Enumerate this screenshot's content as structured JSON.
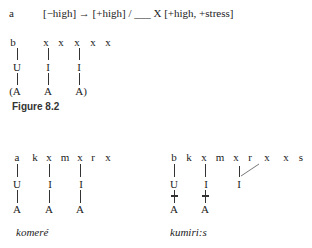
{
  "rule": {
    "label": "a",
    "text": "[−high] → [+high] / ___ X  [+high, +stress]"
  },
  "diagram_b": {
    "label": "b",
    "skeleton": [
      "x",
      "x",
      "x",
      "x",
      "x"
    ],
    "melody_upper": [
      "U",
      "I",
      "I"
    ],
    "melody_lower": [
      "(A",
      "A",
      "A)"
    ]
  },
  "figure_caption": "Figure 8.2",
  "left_example": {
    "segments": [
      "a",
      "k",
      "x",
      "m",
      "x",
      "r",
      "x"
    ],
    "upper": [
      "U",
      "I",
      "I"
    ],
    "lower": [
      "A",
      "A",
      "A"
    ],
    "gloss": "komeré"
  },
  "right_example": {
    "segments": [
      "b",
      "k",
      "x",
      "m",
      "x",
      "r",
      "x",
      "x",
      "s"
    ],
    "upper": [
      "U",
      "I",
      "I"
    ],
    "lower": [
      "A",
      "A"
    ],
    "gloss": "kumiri:s"
  }
}
